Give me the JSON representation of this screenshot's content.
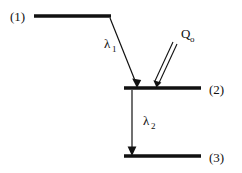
{
  "diagram": {
    "type": "energy-level-diagram",
    "background_color": "#ffffff",
    "stroke_color": "#111111",
    "levels": [
      {
        "id": "level-1",
        "label": "(1)",
        "label_x": 10,
        "label_y": 21,
        "line_x1": 34,
        "line_x2": 111,
        "line_y": 16,
        "thickness": 3.4
      },
      {
        "id": "level-2",
        "label": "(2)",
        "label_x": 209,
        "label_y": 94,
        "line_x1": 124,
        "line_x2": 201,
        "line_y": 88,
        "thickness": 3.4
      },
      {
        "id": "level-3",
        "label": "(3)",
        "label_x": 209,
        "label_y": 162,
        "line_x1": 124,
        "line_x2": 201,
        "line_y": 156,
        "thickness": 3.4
      }
    ],
    "transitions": [
      {
        "id": "lambda-1",
        "symbol": "λ",
        "subscript": "1",
        "label_x": 104,
        "label_y": 48,
        "sub_dx": 8,
        "sub_dy": 4,
        "x1": 110,
        "y1": 18,
        "x2": 137,
        "y2": 86,
        "style": "single-line-solid-arrow"
      },
      {
        "id": "lambda-2",
        "symbol": "λ",
        "subscript": "2",
        "label_x": 143,
        "label_y": 125,
        "sub_dx": 8,
        "sub_dy": 4,
        "x1": 132,
        "y1": 90,
        "x2": 132,
        "y2": 154,
        "style": "single-line-solid-arrow"
      },
      {
        "id": "q-zero",
        "symbol": "Q",
        "subscript": "o",
        "label_x": 181,
        "label_y": 38,
        "sub_dx": 9,
        "sub_dy": 4,
        "x1": 176,
        "y1": 45,
        "x2": 157,
        "y2": 86,
        "style": "double-line-open-arrow"
      }
    ]
  }
}
